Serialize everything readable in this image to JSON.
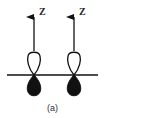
{
  "diagram": {
    "type": "p-orbital diagram",
    "axis_label": "Z",
    "orbitals": [
      {
        "label": "Z",
        "center_x": 34
      },
      {
        "label": "Z",
        "center_x": 74
      }
    ],
    "caption": "(a)",
    "colors": {
      "line": "#111111",
      "filled_lobe": "#111111",
      "open_lobe": "#ffffff"
    }
  }
}
